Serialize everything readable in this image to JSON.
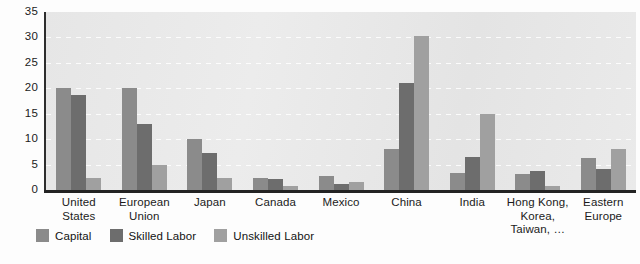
{
  "chart_data": {
    "type": "bar",
    "title": "",
    "subtitle": "",
    "xlabel": "",
    "ylabel": "",
    "ylim": [
      0,
      35
    ],
    "yticks": [
      0,
      5,
      10,
      15,
      20,
      25,
      30,
      35
    ],
    "grid": true,
    "legend_position": "bottom-left",
    "categories": [
      "United States",
      "European Union",
      "Japan",
      "Canada",
      "Mexico",
      "China",
      "India",
      "Hong Kong, Korea, Taiwan, …",
      "Eastern Europe"
    ],
    "category_lines": [
      [
        "United",
        "States"
      ],
      [
        "European",
        "Union"
      ],
      [
        "Japan"
      ],
      [
        "Canada"
      ],
      [
        "Mexico"
      ],
      [
        "China"
      ],
      [
        "India"
      ],
      [
        "Hong Kong,",
        "Korea,",
        "Taiwan, …"
      ],
      [
        "Eastern",
        "Europe"
      ]
    ],
    "series": [
      {
        "name": "Capital",
        "color": "#8b8b8b",
        "values": [
          20.0,
          20.0,
          10.0,
          2.3,
          2.7,
          8.0,
          3.3,
          3.2,
          6.2
        ]
      },
      {
        "name": "Skilled Labor",
        "color": "#6d6d6d",
        "values": [
          18.7,
          13.0,
          7.3,
          2.1,
          1.2,
          21.0,
          6.4,
          3.7,
          4.2
        ]
      },
      {
        "name": "Unskilled Labor",
        "color": "#a0a0a0",
        "values": [
          2.3,
          5.0,
          2.3,
          0.8,
          1.5,
          30.2,
          15.0,
          0.7,
          8.0
        ]
      }
    ]
  },
  "axis": {
    "y_tick_labels": [
      "35",
      "30",
      "25",
      "20",
      "15",
      "10",
      "5",
      "0"
    ]
  },
  "legend": {
    "items": [
      {
        "label": "Capital",
        "key": "capital"
      },
      {
        "label": "Skilled Labor",
        "key": "skilled"
      },
      {
        "label": "Unskilled Labor",
        "key": "unskilled"
      }
    ]
  }
}
